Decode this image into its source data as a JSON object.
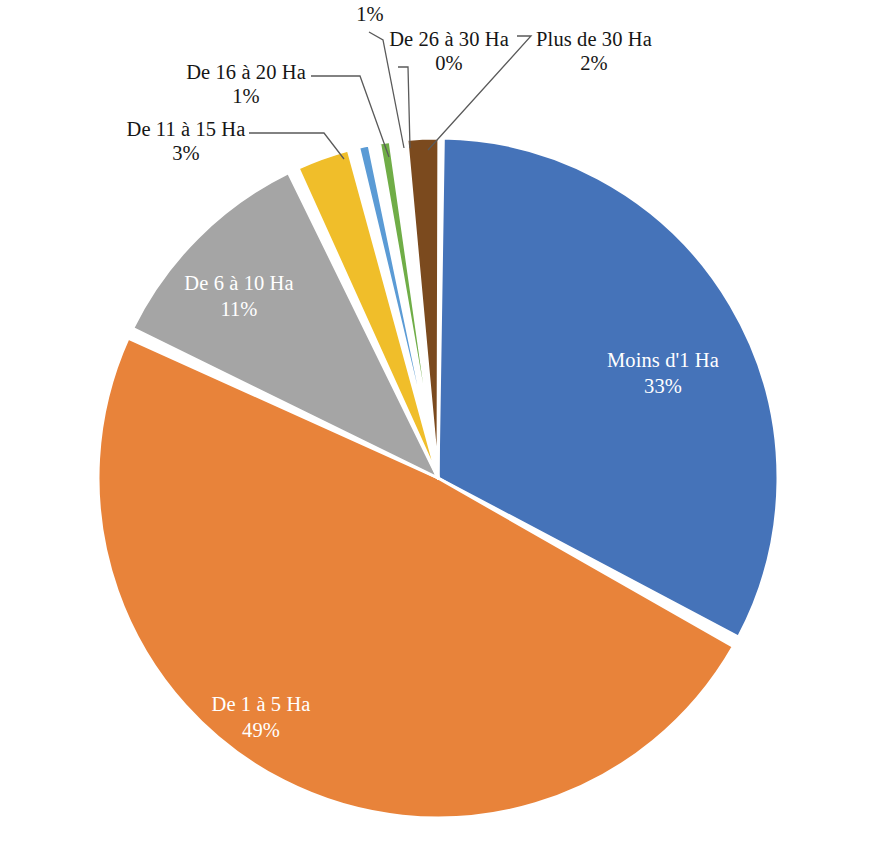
{
  "chart_data": {
    "type": "pie",
    "title": "",
    "subtitle": "",
    "xlabel": "",
    "ylabel": "",
    "legend_position": "none",
    "grid": false,
    "label_format": "category name + percentage",
    "start_angle_deg": 0,
    "direction": "clockwise",
    "categories": [
      "Moins d'1 Ha",
      "De 1 à 5 Ha",
      "De 6 à 10 Ha",
      "De 11 à 15 Ha",
      "De 16 à 20 Ha",
      "",
      "De 26 à 30 Ha",
      "Plus de 30 Ha"
    ],
    "values": [
      33,
      49,
      11,
      3,
      1,
      1,
      0,
      2
    ],
    "value_labels": [
      "33%",
      "49%",
      "11%",
      "3%",
      "1%",
      "1%",
      "0%",
      "2%"
    ],
    "colors": [
      "#4573B9",
      "#E8833A",
      "#A5A5A5",
      "#F0BE2A",
      "#5B9BD5",
      "#70AD47",
      "#264478",
      "#7B4A1E"
    ],
    "slices": [
      {
        "name": "Moins d'1 Ha",
        "label": "Moins d'1 Ha",
        "percent_label": "33%",
        "value": 33,
        "color": "#4573B9",
        "label_placement": "inside",
        "label_color": "#ffffff"
      },
      {
        "name": "De 1 à 5 Ha",
        "label": "De 1 à 5 Ha",
        "percent_label": "49%",
        "value": 49,
        "color": "#E8833A",
        "label_placement": "inside",
        "label_color": "#ffffff"
      },
      {
        "name": "De 6 à 10 Ha",
        "label": "De 6 à 10 Ha",
        "percent_label": "11%",
        "value": 11,
        "color": "#A5A5A5",
        "label_placement": "inside",
        "label_color": "#ffffff"
      },
      {
        "name": "De 11 à 15 Ha",
        "label": "De 11 à 15 Ha",
        "percent_label": "3%",
        "value": 3,
        "color": "#F0BE2A",
        "label_placement": "callout",
        "label_color": "#161616"
      },
      {
        "name": "De 16 à 20 Ha",
        "label": "De 16 à 20 Ha",
        "percent_label": "1%",
        "value": 1,
        "color": "#5B9BD5",
        "label_placement": "callout",
        "label_color": "#161616"
      },
      {
        "name": "",
        "label": "",
        "percent_label": "1%",
        "value": 1,
        "color": "#70AD47",
        "label_placement": "callout",
        "label_color": "#161616"
      },
      {
        "name": "De 26 à 30 Ha",
        "label": "De 26 à 30 Ha",
        "percent_label": "0%",
        "value": 0,
        "color": "#264478",
        "label_placement": "callout",
        "label_color": "#161616"
      },
      {
        "name": "Plus de 30 Ha",
        "label": "Plus de 30 Ha",
        "percent_label": "2%",
        "value": 2,
        "color": "#7B4A1E",
        "label_placement": "callout",
        "label_color": "#161616"
      }
    ]
  },
  "labels": {
    "moins_1ha_cat": "Moins d'1 Ha",
    "moins_1ha_pct": "33%",
    "de1a5_cat": "De 1 à 5 Ha",
    "de1a5_pct": "49%",
    "de6a10_cat": "De 6 à 10 Ha",
    "de6a10_pct": "11%",
    "de11a15_cat": "De 11 à 15 Ha",
    "de11a15_pct": "3%",
    "de16a20_cat": "De 16 à 20 Ha",
    "de16a20_pct": "1%",
    "de21a25_pct": "1%",
    "de26a30_cat": "De 26 à 30 Ha",
    "de26a30_pct": "0%",
    "plus30_cat": "Plus de 30 Ha",
    "plus30_pct": "2%"
  }
}
